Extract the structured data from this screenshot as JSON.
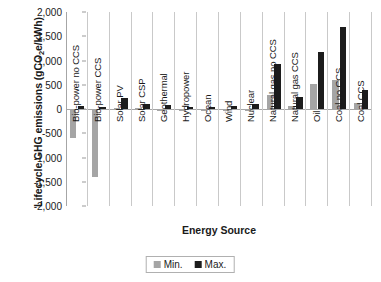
{
  "chart_data": {
    "type": "bar",
    "title": "",
    "xlabel": "Energy Source",
    "ylabel": "Lifecycle GHG emissions (gCO2e/kWh)",
    "ylabel_parts": {
      "pre": "Lifecycle GHG emissions (gCO",
      "sub": "2",
      "post": "e/kWh)"
    },
    "ylim": [
      -2000,
      2000
    ],
    "ytick_step": 500,
    "grid": false,
    "legend_position": "bottom",
    "yticks": [
      "2,000",
      "1,500",
      "1,000",
      "500",
      "0",
      "-500",
      "-1,000",
      "-1,500",
      "-2,000"
    ],
    "ytick_values": [
      2000,
      1500,
      1000,
      500,
      0,
      -500,
      -1000,
      -1500,
      -2000
    ],
    "categories": [
      "Bio-power no CCS",
      "Bio-power CCS",
      "Solar PV",
      "Solar CSP",
      "Geothermal",
      "Hydropower",
      "Ocean",
      "Wind",
      "Nuclear",
      "Natural gas no CCS",
      "Natural gas CCS",
      "Oil",
      "Coal no CCS",
      "Coal CCS"
    ],
    "series": [
      {
        "name": "Min.",
        "color": "#a5a5a5",
        "values": [
          -600,
          -1400,
          20,
          15,
          10,
          5,
          10,
          5,
          5,
          290,
          60,
          520,
          590,
          120
        ]
      },
      {
        "name": "Max.",
        "color": "#1c1c1c",
        "values": [
          60,
          40,
          220,
          100,
          80,
          45,
          35,
          60,
          110,
          930,
          240,
          1170,
          1690,
          390
        ]
      }
    ]
  },
  "legend": {
    "entries": [
      {
        "label": "Min.",
        "color": "#a5a5a5"
      },
      {
        "label": "Max.",
        "color": "#1c1c1c"
      }
    ]
  },
  "colors": {
    "min_series": "#a5a5a5",
    "max_series": "#1c1c1c",
    "axis": "#a6a6a6",
    "separator": "#c9c9c9",
    "text": "#1a1a1a",
    "background": "#ffffff"
  }
}
